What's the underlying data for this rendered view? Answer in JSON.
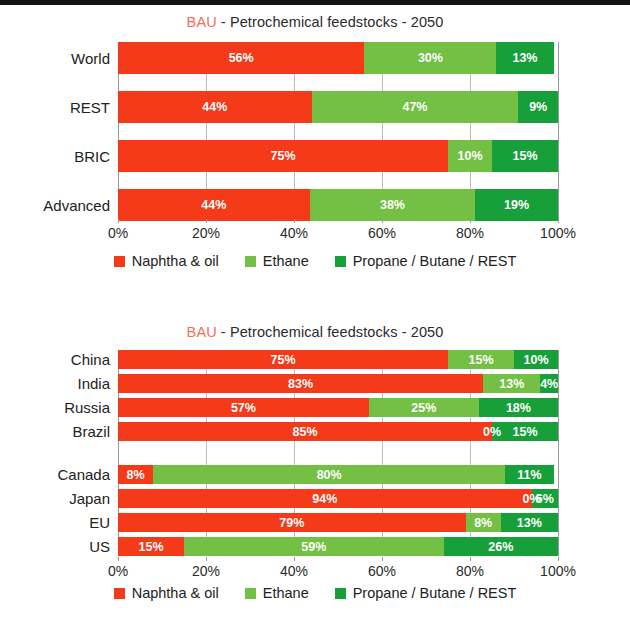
{
  "colors": {
    "naphtha": "#f43a18",
    "ethane": "#74c044",
    "propane": "#17a03a",
    "bau_accent": "#f0705c",
    "gridline": "#bdbdbd",
    "text": "#222222"
  },
  "legend": {
    "items": [
      {
        "label": "Naphtha & oil",
        "color": "#f43a18",
        "key": "naphtha"
      },
      {
        "label": "Ethane",
        "color": "#74c044",
        "key": "ethane"
      },
      {
        "label": "Propane / Butane / REST",
        "color": "#17a03a",
        "key": "propane"
      }
    ]
  },
  "axis": {
    "ticks": [
      "0%",
      "20%",
      "40%",
      "60%",
      "80%",
      "100%"
    ],
    "tick_values": [
      0,
      20,
      40,
      60,
      80,
      100
    ],
    "min": 0,
    "max": 100
  },
  "charts": [
    {
      "id": "chart-top",
      "title_prefix": "BAU",
      "title_rest": " - Petrochemical feedstocks - 2050"
    },
    {
      "id": "chart-bottom",
      "title_prefix": "BAU",
      "title_rest": " - Petrochemical feedstocks - 2050"
    }
  ],
  "chart_data": [
    {
      "type": "bar",
      "orientation": "horizontal",
      "stacked": true,
      "normalized": "100%",
      "title": "BAU - Petrochemical feedstocks - 2050",
      "xlabel": "",
      "ylabel": "",
      "xlim": [
        0,
        100
      ],
      "grid": true,
      "legend_position": "bottom",
      "xticks": [
        "0%",
        "20%",
        "40%",
        "60%",
        "80%",
        "100%"
      ],
      "categories": [
        "World",
        "REST",
        "BRIC",
        "Advanced"
      ],
      "series": [
        {
          "name": "Naphtha & oil",
          "color": "#f43a18",
          "values": [
            56,
            44,
            75,
            44
          ],
          "labels": [
            "56%",
            "44%",
            "75%",
            "44%"
          ]
        },
        {
          "name": "Ethane",
          "color": "#74c044",
          "values": [
            30,
            47,
            10,
            38
          ],
          "labels": [
            "30%",
            "47%",
            "10%",
            "38%"
          ]
        },
        {
          "name": "Propane / Butane / REST",
          "color": "#17a03a",
          "values": [
            13,
            9,
            15,
            19
          ],
          "labels": [
            "13%",
            "9%",
            "15%",
            "19%"
          ]
        }
      ]
    },
    {
      "type": "bar",
      "orientation": "horizontal",
      "stacked": true,
      "normalized": "100%",
      "title": "BAU - Petrochemical feedstocks - 2050",
      "xlabel": "",
      "ylabel": "",
      "xlim": [
        0,
        100
      ],
      "grid": true,
      "legend_position": "bottom",
      "xticks": [
        "0%",
        "20%",
        "40%",
        "60%",
        "80%",
        "100%"
      ],
      "categories": [
        "China",
        "India",
        "Russia",
        "Brazil",
        "",
        "Canada",
        "Japan",
        "EU",
        "US"
      ],
      "series": [
        {
          "name": "Naphtha & oil",
          "color": "#f43a18",
          "values": [
            75,
            83,
            57,
            85,
            null,
            8,
            94,
            79,
            15
          ],
          "labels": [
            "75%",
            "83%",
            "57%",
            "85%",
            "",
            "8%",
            "94%",
            "79%",
            "15%"
          ]
        },
        {
          "name": "Ethane",
          "color": "#74c044",
          "values": [
            15,
            13,
            25,
            0,
            null,
            80,
            0,
            8,
            59
          ],
          "labels": [
            "15%",
            "13%",
            "25%",
            "0%",
            "",
            "80%",
            "0%",
            "8%",
            "59%"
          ]
        },
        {
          "name": "Propane / Butane / REST",
          "color": "#17a03a",
          "values": [
            10,
            4,
            18,
            15,
            null,
            11,
            6,
            13,
            26
          ],
          "labels": [
            "10%",
            "4%",
            "18%",
            "15%",
            "",
            "11%",
            "6%",
            "13%",
            "26%"
          ]
        }
      ]
    }
  ]
}
